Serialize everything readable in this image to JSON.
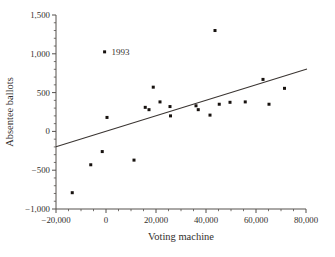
{
  "figure": {
    "background": "#ffffff",
    "text_color": "#332f2d",
    "axis_color": "#55504d",
    "point_color": "#17120f",
    "line_color": "#3a3532"
  },
  "chart_data": {
    "type": "scatter",
    "title": "",
    "xlabel": "Voting machine",
    "ylabel": "Absentee ballots",
    "xlim": [
      -20000,
      80000
    ],
    "ylim": [
      -1000,
      1500
    ],
    "grid": false,
    "legend": null,
    "x_ticks": [
      {
        "value": -20000,
        "label": "−20,000"
      },
      {
        "value": 0,
        "label": "0"
      },
      {
        "value": 20000,
        "label": "20,000"
      },
      {
        "value": 40000,
        "label": "40,000"
      },
      {
        "value": 60000,
        "label": "60,000"
      },
      {
        "value": 80000,
        "label": "80,000"
      }
    ],
    "y_ticks": [
      {
        "value": -1000,
        "label": "−1,000"
      },
      {
        "value": -500,
        "label": "−500"
      },
      {
        "value": 0,
        "label": "0"
      },
      {
        "value": 500,
        "label": "500"
      },
      {
        "value": 1000,
        "label": "1,000"
      },
      {
        "value": 1500,
        "label": "1,500"
      }
    ],
    "x_minor_step": 5000,
    "y_minor_step": 100,
    "points": [
      [
        -13500,
        -790
      ],
      [
        -6100,
        -430
      ],
      [
        -1500,
        -260
      ],
      [
        -564,
        1025
      ],
      [
        400,
        180
      ],
      [
        11200,
        -370
      ],
      [
        15700,
        310
      ],
      [
        17200,
        280
      ],
      [
        18900,
        570
      ],
      [
        21600,
        380
      ],
      [
        25600,
        320
      ],
      [
        25800,
        200
      ],
      [
        36000,
        330
      ],
      [
        36900,
        280
      ],
      [
        41600,
        210
      ],
      [
        43600,
        1300
      ],
      [
        45300,
        350
      ],
      [
        49600,
        375
      ],
      [
        55700,
        380
      ],
      [
        62800,
        670
      ],
      [
        65200,
        350
      ],
      [
        71400,
        555
      ]
    ],
    "annotation": {
      "label": "1993",
      "x": -564,
      "y": 1025
    },
    "regression_line": {
      "x1": -20000,
      "y1": -197,
      "x2": 80400,
      "y2": 803
    }
  }
}
